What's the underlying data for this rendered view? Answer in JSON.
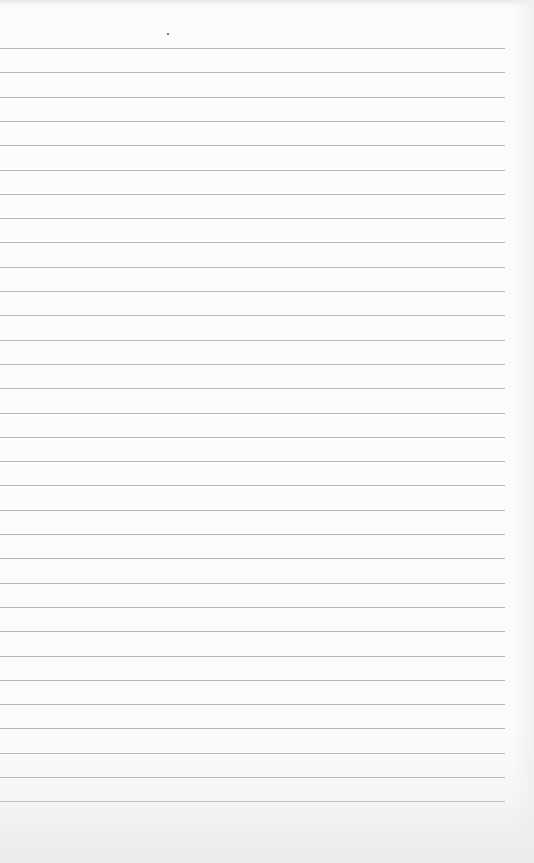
{
  "paper": {
    "type": "ruled-notebook-page",
    "background_color": "#fbfbfb",
    "rule_color": "#b9b9b9",
    "rule_count": 32,
    "first_rule_y": 48,
    "rule_spacing": 24.3,
    "rule_left_x": 0,
    "rule_right_x": 505,
    "speck": {
      "x": 167,
      "y": 33
    }
  }
}
